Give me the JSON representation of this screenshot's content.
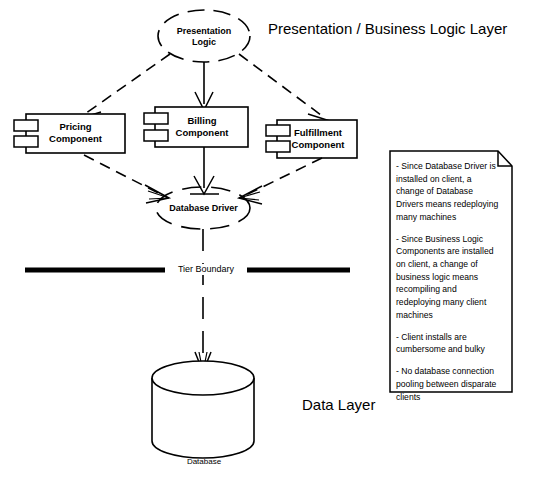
{
  "diagram": {
    "title_presentation_layer": "Presentation / Business Logic Layer",
    "title_data_layer": "Data Layer",
    "boundary_label": "Tier Boundary",
    "nodes": {
      "presentation_logic": "Presentation\nLogic",
      "presentation_logic_line1": "Presentation",
      "presentation_logic_line2": "Logic",
      "pricing_component_line1": "Pricing",
      "pricing_component_line2": "Component",
      "billing_component_line1": "Billing",
      "billing_component_line2": "Component",
      "fulfillment_component_line1": "Fulfillment",
      "fulfillment_component_line2": "Component",
      "database_driver": "Database Driver",
      "database_caption": "Database"
    },
    "note": {
      "bullets": [
        "- Since Database Driver is installed on client, a change of Database Drivers means redeploying many machines",
        "- Since Business Logic Components are installed on client, a change of business logic means recompiling and redeploying many client machines",
        "- Client installs are cumbersome and bulky",
        "- No database connection pooling between disparate clients"
      ]
    },
    "colors": {
      "stroke": "#000000",
      "background": "#ffffff",
      "text": "#000000"
    }
  }
}
